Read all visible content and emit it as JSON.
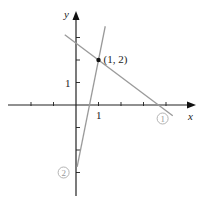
{
  "diagram": {
    "axes": {
      "x_label": "x",
      "y_label": "y",
      "x_tick_label": "1",
      "y_tick_label": "1",
      "x_range": [
        -3,
        4.4
      ],
      "y_range": [
        -4,
        4
      ],
      "x_ticks": [
        -2,
        -1,
        1,
        2,
        3,
        4
      ],
      "y_ticks": [
        -3,
        -2,
        -1,
        1,
        2,
        3
      ]
    },
    "lines": [
      {
        "id": "1",
        "label": "1",
        "slope": -0.75,
        "intercept": 2.75,
        "x_from": -0.5,
        "x_to": 4.3,
        "color": "#9a9a9a"
      },
      {
        "id": "2",
        "label": "2",
        "slope": 5,
        "intercept": -3,
        "x_from": 0.05,
        "x_to": 1.3,
        "color": "#9a9a9a"
      }
    ],
    "point": {
      "x": 1,
      "y": 2,
      "label": "(1, 2)"
    }
  }
}
